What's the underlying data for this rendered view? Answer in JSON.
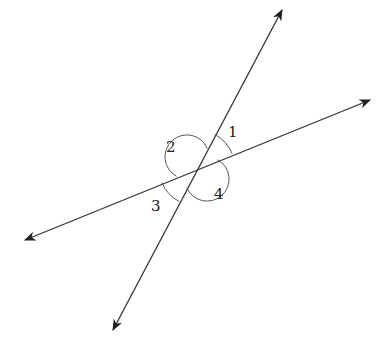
{
  "diagram": {
    "line_color": "#333333",
    "lines": [
      {
        "name": "line-a",
        "from": [
          25,
          240
        ],
        "to": [
          370,
          100
        ]
      },
      {
        "name": "line-b",
        "from": [
          113,
          330
        ],
        "to": [
          282,
          10
        ]
      }
    ],
    "intersection": [
      197,
      168
    ],
    "angles": [
      {
        "label": "1",
        "x": 228,
        "y": 137
      },
      {
        "label": "2",
        "x": 166,
        "y": 152
      },
      {
        "label": "3",
        "x": 151,
        "y": 211
      },
      {
        "label": "4",
        "x": 214,
        "y": 199
      }
    ]
  }
}
